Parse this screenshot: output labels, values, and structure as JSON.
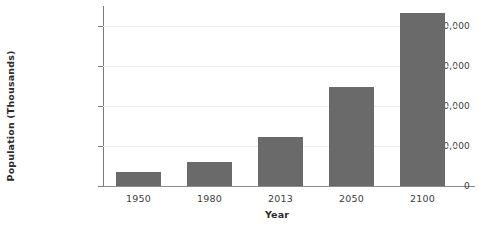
{
  "chart_data": {
    "type": "bar",
    "title": "",
    "xlabel": "Year",
    "ylabel": "Population (Thousands)",
    "categories": [
      "1950",
      "1980",
      "2013",
      "2050",
      "2100"
    ],
    "values": [
      345000,
      600000,
      1235000,
      2470000,
      4320000
    ],
    "series": [
      {
        "name": "Population",
        "values": [
          345000,
          600000,
          1235000,
          2470000,
          4320000
        ]
      }
    ],
    "ylim": [
      0,
      4500000
    ],
    "yticks": [
      0,
      1000000,
      2000000,
      3000000,
      4000000
    ],
    "ytick_labels": [
      "0",
      "1,000,000",
      "2,000,000",
      "3,000,000",
      "4,000,000"
    ],
    "grid": true,
    "legend": null,
    "bar_color": "#6a6a6a",
    "background_color": "#ffffff",
    "gridline_color": "#ececec",
    "axis_color": "#7b7b7b"
  }
}
